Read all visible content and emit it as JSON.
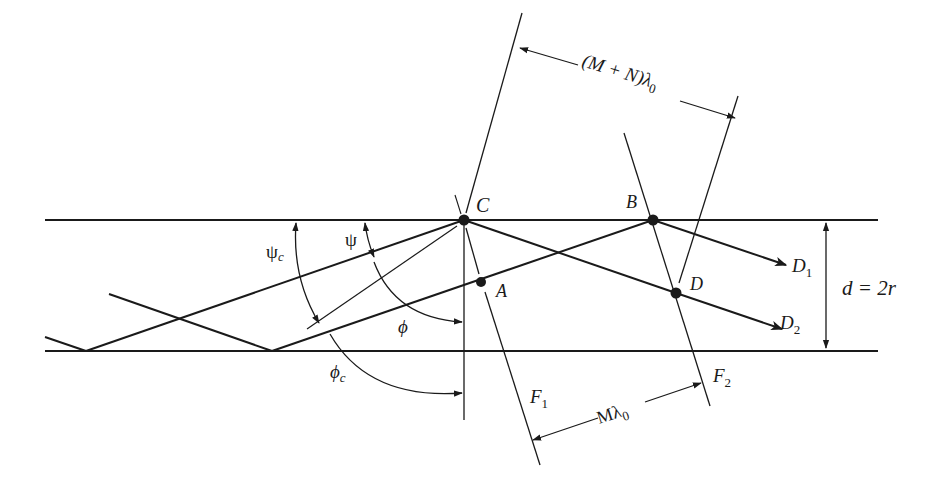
{
  "diagram": {
    "type": "waveguide ray diagram",
    "colors": {
      "ink": "#1a1a1a",
      "background": "#ffffff"
    },
    "guide": {
      "top_y": 220,
      "bottom_y": 351,
      "x_start": 45,
      "x_end": 878,
      "width_label": "d = 2r"
    },
    "points": {
      "C": {
        "label": "C",
        "x": 464,
        "y": 220
      },
      "B": {
        "label": "B",
        "x": 653,
        "y": 220
      },
      "A": {
        "label": "A",
        "x": 481,
        "y": 282
      },
      "D": {
        "label": "D",
        "x": 676,
        "y": 293
      }
    },
    "rays": {
      "D1": {
        "label": "D",
        "sub": "1"
      },
      "D2": {
        "label": "D",
        "sub": "2"
      }
    },
    "angles": {
      "psi": {
        "label": "ψ"
      },
      "psi_c": {
        "label": "ψ",
        "sub": "c"
      },
      "phi": {
        "label": "ϕ"
      },
      "phi_c": {
        "label": "ϕ",
        "sub": "c"
      }
    },
    "wavefronts": {
      "F1": {
        "label": "F",
        "sub": "1"
      },
      "F2": {
        "label": "F",
        "sub": "2"
      }
    },
    "dimensions": {
      "top": {
        "prefix": "(M + N)λ",
        "sub": "0"
      },
      "bottom": {
        "prefix": "Mλ",
        "sub": "0"
      }
    }
  }
}
